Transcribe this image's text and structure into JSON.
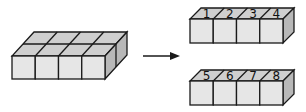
{
  "diagram": {
    "source_block": {
      "rows": 2,
      "columns": 4
    },
    "arrow": {
      "direction": "right"
    },
    "result_rows": [
      {
        "labels": [
          "1",
          "2",
          "3",
          "4"
        ]
      },
      {
        "labels": [
          "5",
          "6",
          "7",
          "8"
        ]
      }
    ],
    "colors": {
      "front_face": "#e6e6e6",
      "top_face": "#cfcfcf",
      "side_face": "#b8b8b8",
      "edges": "#1a1a1a"
    }
  }
}
